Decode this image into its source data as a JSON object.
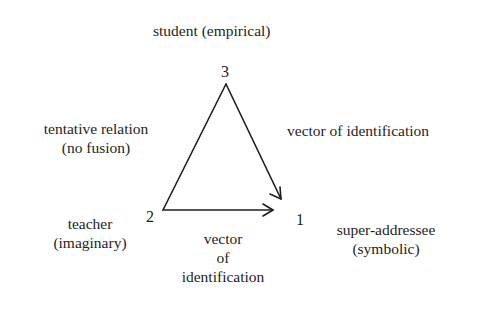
{
  "nodes": {
    "n3": {
      "number": "3",
      "label_line1": "student (empirical)"
    },
    "n2": {
      "number": "2",
      "label_line1": "teacher",
      "label_line2": "(imaginary)"
    },
    "n1": {
      "number": "1",
      "label_line1": "super-addressee",
      "label_line2": "(symbolic)"
    }
  },
  "edges": {
    "left": {
      "line1": "tentative relation",
      "line2": "(no fusion)"
    },
    "right": {
      "line1": "vector of identification"
    },
    "bottom": {
      "line1": "vector",
      "line2": "of",
      "line3": "identification"
    }
  },
  "colors": {
    "stroke": "#1e1e1e",
    "background": "#ffffff"
  }
}
